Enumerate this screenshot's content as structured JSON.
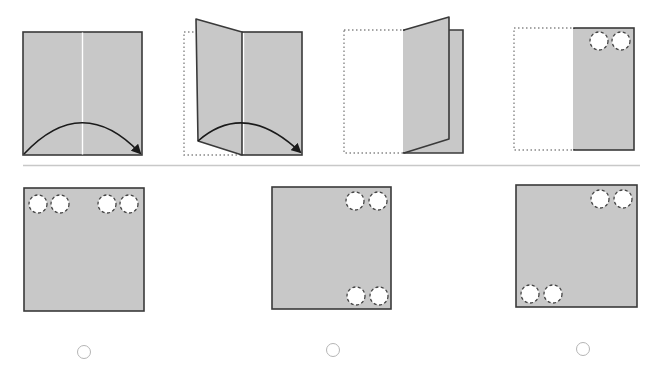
{
  "puzzle": {
    "type": "paper-folding",
    "colors": {
      "paper": "#c8c8c8",
      "outline": "#3a3a3a",
      "crease": "#ffffff",
      "dotted": "#888888",
      "hole_dash": "#444444",
      "divider": "#c8c8c8",
      "radio": "#b5b5b5"
    },
    "steps": [
      {
        "label": "Step 1: square paper with vertical center crease; arrow shows left half folding over to the right"
      },
      {
        "label": "Step 2: left half lifting and folding over along the crease"
      },
      {
        "label": "Step 3: left half almost fully folded onto right half"
      },
      {
        "label": "Step 4: folded paper with two holes punched at top-right"
      }
    ],
    "options": [
      {
        "id": "A",
        "label": "Option A: four holes across the top edge (two at left, two at right)",
        "selected": false
      },
      {
        "id": "B",
        "label": "Option B: two holes top-right and two holes bottom-right",
        "selected": false
      },
      {
        "id": "C",
        "label": "Option C: two holes top-right and two holes bottom-left",
        "selected": false
      }
    ]
  }
}
